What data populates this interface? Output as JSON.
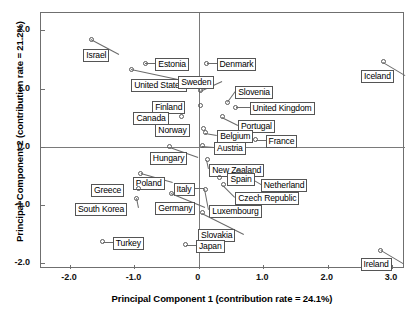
{
  "chart_data": {
    "type": "scatter",
    "title": "",
    "xlabel": "Principal Component 1 (contribution rate = 24.1%)",
    "ylabel": "Principal Component 2 (contribution rate = 21.2%)",
    "xlim": [
      -2.45,
      3.2
    ],
    "ylim": [
      -2.1,
      2.3
    ],
    "xticks": [
      -2.0,
      -1.0,
      0,
      1.0,
      2.0,
      3.0
    ],
    "xticklabels": [
      "-2.0",
      "-1.0",
      "0",
      "1.0",
      "2.0",
      "3.0"
    ],
    "yticks": [
      2.0,
      1.0,
      0.0,
      -1.0,
      -2.0
    ],
    "yticklabels": [
      "2.0",
      "1.0",
      "0.0",
      "-1.0",
      "-2.0"
    ],
    "grid": false,
    "legend": "none",
    "reference_lines": {
      "x": 0,
      "y": 0
    },
    "points": [
      {
        "label": "Israel",
        "x": -1.67,
        "y": 1.85
      },
      {
        "label": "United States",
        "x": -1.05,
        "y": 1.33
      },
      {
        "label": "Estonia",
        "x": -0.83,
        "y": 1.44
      },
      {
        "label": "Denmark",
        "x": 0.12,
        "y": 1.44
      },
      {
        "label": "Iceland",
        "x": 2.86,
        "y": 1.46
      },
      {
        "label": "Sweden",
        "x": 0.02,
        "y": 0.96
      },
      {
        "label": "Slovenia",
        "x": 0.44,
        "y": 0.77
      },
      {
        "label": "Finland",
        "x": 0.02,
        "y": 0.71
      },
      {
        "label": "United Kingdom",
        "x": 0.57,
        "y": 0.68
      },
      {
        "label": "Canada",
        "x": -0.27,
        "y": 0.52
      },
      {
        "label": "Portugal",
        "x": 0.36,
        "y": 0.52
      },
      {
        "label": "Norway",
        "x": 0.07,
        "y": 0.32
      },
      {
        "label": "Belgium",
        "x": 0.1,
        "y": 0.24
      },
      {
        "label": "France",
        "x": 0.88,
        "y": 0.12
      },
      {
        "label": "Austria",
        "x": 0.05,
        "y": 0.02
      },
      {
        "label": "Hungary",
        "x": -0.45,
        "y": 0.0
      },
      {
        "label": "New Zealand",
        "x": 0.13,
        "y": -0.22
      },
      {
        "label": "Netherland",
        "x": 0.62,
        "y": -0.42
      },
      {
        "label": "Spain",
        "x": 0.32,
        "y": -0.53
      },
      {
        "label": "Poland",
        "x": -0.9,
        "y": -0.45
      },
      {
        "label": "Czech Republic",
        "x": 0.38,
        "y": -0.65
      },
      {
        "label": "Italy",
        "x": -0.3,
        "y": -0.7
      },
      {
        "label": "Greece",
        "x": -0.93,
        "y": -0.72
      },
      {
        "label": "Luxembourg",
        "x": 0.1,
        "y": -0.73
      },
      {
        "label": "South Korea",
        "x": -0.96,
        "y": -0.88
      },
      {
        "label": "Germany",
        "x": -0.43,
        "y": -0.8
      },
      {
        "label": "Slovakia",
        "x": 0.05,
        "y": -1.13
      },
      {
        "label": "Turkey",
        "x": -1.49,
        "y": -1.63
      },
      {
        "label": "Japan",
        "x": -0.2,
        "y": -1.68
      },
      {
        "label": "Ireland",
        "x": 2.82,
        "y": -1.78
      }
    ]
  },
  "labels": {
    "israel": "Israel",
    "united_states": "United States",
    "estonia": "Estonia",
    "denmark": "Denmark",
    "iceland": "Iceland",
    "sweden": "Sweden",
    "slovenia": "Slovenia",
    "finland": "Finland",
    "united_kingdom": "United Kingdom",
    "canada": "Canada",
    "portugal": "Portugal",
    "norway": "Norway",
    "belgium": "Belgium",
    "france": "France",
    "austria": "Austria",
    "hungary": "Hungary",
    "new_zealand": "New Zealand",
    "netherland": "Netherland",
    "spain": "Spain",
    "poland": "Poland",
    "czech_republic": "Czech Republic",
    "italy": "Italy",
    "greece": "Greece",
    "luxembourg": "Luxembourg",
    "south_korea": "South Korea",
    "germany": "Germany",
    "slovakia": "Slovakia",
    "turkey": "Turkey",
    "japan": "Japan",
    "ireland": "Ireland"
  },
  "axes": {
    "x_title": "Principal Component 1 (contribution rate = 24.1%)",
    "y_title": "Principal Component 2 (contribution rate = 21.2%)"
  }
}
